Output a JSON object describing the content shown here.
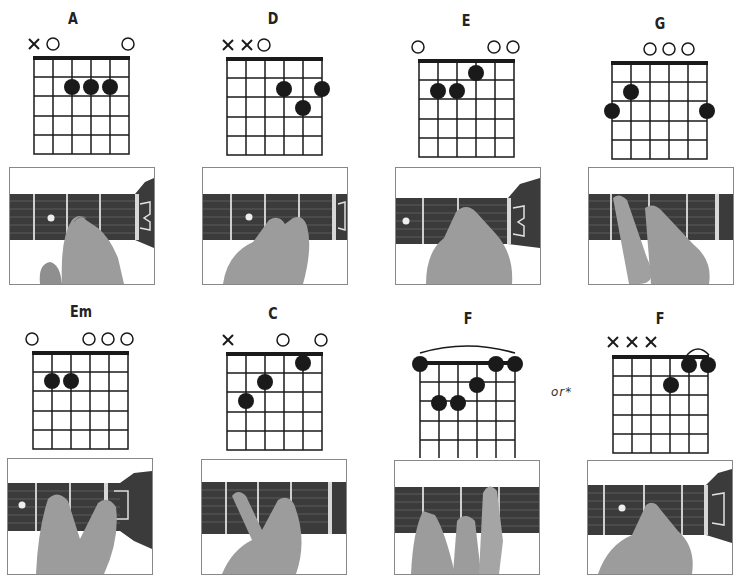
{
  "chords": [
    {
      "name": "A",
      "id": "A",
      "markers": [
        "x",
        "o",
        "",
        "",
        "",
        "o"
      ],
      "barre": null,
      "frets": [
        null,
        0,
        2,
        2,
        2,
        0
      ],
      "dots": [
        {
          "string": 3,
          "fret": 2
        },
        {
          "string": 4,
          "fret": 2
        },
        {
          "string": 5,
          "fret": 2
        }
      ]
    },
    {
      "name": "D",
      "id": "D",
      "markers": [
        "x",
        "x",
        "o",
        "",
        "",
        ""
      ],
      "barre": null,
      "frets": [
        null,
        null,
        0,
        2,
        3,
        2
      ],
      "dots": [
        {
          "string": 4,
          "fret": 2
        },
        {
          "string": 6,
          "fret": 2
        },
        {
          "string": 5,
          "fret": 3
        }
      ]
    },
    {
      "name": "E",
      "id": "E",
      "markers": [
        "o",
        "",
        "",
        "",
        "o",
        "o"
      ],
      "barre": null,
      "frets": [
        0,
        2,
        2,
        1,
        0,
        0
      ],
      "dots": [
        {
          "string": 4,
          "fret": 1
        },
        {
          "string": 2,
          "fret": 2
        },
        {
          "string": 3,
          "fret": 2
        }
      ]
    },
    {
      "name": "G",
      "id": "G",
      "markers": [
        "",
        "",
        "o",
        "o",
        "o",
        ""
      ],
      "barre": null,
      "frets": [
        3,
        2,
        0,
        0,
        0,
        3
      ],
      "dots": [
        {
          "string": 2,
          "fret": 2
        },
        {
          "string": 1,
          "fret": 3
        },
        {
          "string": 6,
          "fret": 3
        }
      ]
    },
    {
      "name": "Em",
      "id": "Em",
      "markers": [
        "o",
        "",
        "",
        "o",
        "o",
        "o"
      ],
      "barre": null,
      "frets": [
        0,
        2,
        2,
        0,
        0,
        0
      ],
      "dots": [
        {
          "string": 2,
          "fret": 2
        },
        {
          "string": 3,
          "fret": 2
        }
      ]
    },
    {
      "name": "C",
      "id": "C",
      "markers": [
        "x",
        "",
        "",
        "o",
        "",
        "o"
      ],
      "barre": null,
      "frets": [
        null,
        3,
        2,
        0,
        1,
        0
      ],
      "dots": [
        {
          "string": 5,
          "fret": 1
        },
        {
          "string": 3,
          "fret": 2
        },
        {
          "string": 2,
          "fret": 3
        }
      ]
    },
    {
      "name": "F",
      "id": "F-barre",
      "markers": [
        "",
        "",
        "",
        "",
        "",
        ""
      ],
      "barre": {
        "from": 1,
        "to": 6,
        "fret": 1
      },
      "frets": [
        1,
        3,
        3,
        2,
        1,
        1
      ],
      "dots": [
        {
          "string": 1,
          "fret": 1
        },
        {
          "string": 5,
          "fret": 1
        },
        {
          "string": 6,
          "fret": 1
        },
        {
          "string": 4,
          "fret": 2
        },
        {
          "string": 2,
          "fret": 3
        },
        {
          "string": 3,
          "fret": 3
        }
      ]
    },
    {
      "name": "F",
      "id": "F-small",
      "markers": [
        "x",
        "x",
        "x",
        "",
        "",
        ""
      ],
      "barre": {
        "from": 5,
        "to": 6,
        "fret": 1
      },
      "frets": [
        null,
        null,
        null,
        3,
        1,
        1
      ],
      "dots": [
        {
          "string": 5,
          "fret": 1
        },
        {
          "string": 6,
          "fret": 1
        },
        {
          "string": 4,
          "fret": 2
        }
      ]
    }
  ],
  "or_label": "or*",
  "photo_captions": [
    "A chord hand position",
    "D chord hand position",
    "E chord hand position",
    "G chord hand position",
    "Em chord hand position",
    "C chord hand position",
    "F chord hand position",
    "F alternate hand position"
  ],
  "colors": {
    "ink": "#1a1a1a",
    "fretboard": "#3a3a3a",
    "skin": "#9a9a9a",
    "photo_border": "#888888"
  }
}
